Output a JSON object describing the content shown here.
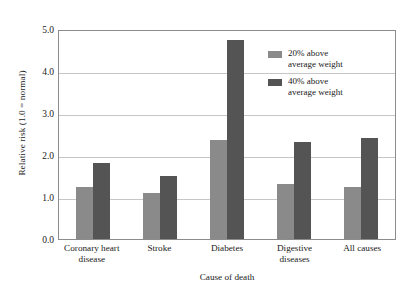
{
  "chart_data": {
    "type": "bar",
    "title": "",
    "xlabel": "Cause of death",
    "ylabel": "Relative risk (1.0 = normal)",
    "categories": [
      "Coronary heart disease",
      "Stroke",
      "Diabetes",
      "Digestive diseases",
      "All causes"
    ],
    "category_lines": [
      [
        "Coronary heart",
        "disease"
      ],
      [
        "Stroke"
      ],
      [
        "Diabetes"
      ],
      [
        "Digestive",
        "diseases"
      ],
      [
        "All causes"
      ]
    ],
    "series": [
      {
        "name": "20% above average weight",
        "name_lines": [
          "20% above",
          "average weight"
        ],
        "color": "#8a8a8a",
        "values": [
          1.25,
          1.1,
          2.35,
          1.3,
          1.25
        ]
      },
      {
        "name": "40% above average weight",
        "name_lines": [
          "40% above",
          "average weight"
        ],
        "color": "#545454",
        "values": [
          1.8,
          1.5,
          4.75,
          2.3,
          2.4
        ]
      }
    ],
    "ylim": [
      0.0,
      5.0
    ],
    "yticks": [
      0.0,
      1.0,
      2.0,
      3.0,
      4.0,
      5.0
    ],
    "ytick_labels": [
      "0.0",
      "1.0",
      "2.0",
      "3.0",
      "4.0",
      "5.0"
    ],
    "grid": true,
    "legend_position": "upper right",
    "axis_color": "#8c8c8c",
    "grid_color": "#c6c6c6",
    "background": "#ffffff"
  }
}
